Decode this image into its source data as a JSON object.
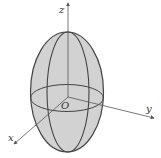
{
  "diagram": {
    "type": "ellipsoid-3d",
    "axes": {
      "x": {
        "label": "x"
      },
      "y": {
        "label": "y"
      },
      "z": {
        "label": "z"
      }
    },
    "origin": {
      "label": "O"
    },
    "colors": {
      "fill": "#d2d2d2",
      "stroke": "#444444",
      "axis": "#555555",
      "background": "#ffffff"
    }
  }
}
